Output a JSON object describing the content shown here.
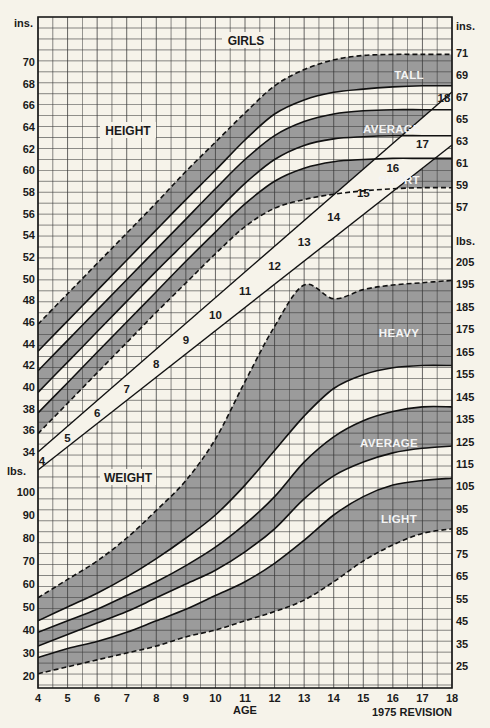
{
  "chart_data": {
    "type": "line",
    "title": "GIRLS",
    "subtitle": "1975 REVISION",
    "xlabel": "AGE",
    "x": [
      4,
      5,
      6,
      7,
      8,
      9,
      10,
      11,
      12,
      13,
      14,
      15,
      16,
      17,
      18
    ],
    "sections": {
      "height": {
        "label": "HEIGHT",
        "unit_left": "ins.",
        "unit_right": "ins.",
        "left_ticks": [
          34,
          36,
          38,
          40,
          42,
          44,
          46,
          48,
          50,
          52,
          54,
          56,
          58,
          60,
          62,
          64,
          66,
          68,
          70
        ],
        "right_ticks": [
          57,
          59,
          61,
          63,
          65,
          67,
          69,
          71
        ],
        "bands": [
          {
            "name": "TALL",
            "upper_dashed": true
          },
          {
            "name": "AVERAGE",
            "upper_dashed": false
          },
          {
            "name": "SHORT",
            "lower_dashed": true
          }
        ],
        "series": [
          {
            "name": "tall-upper (dashed)",
            "values": [
              45.8,
              48.6,
              51.4,
              54.2,
              57.0,
              59.9,
              62.6,
              65.3,
              67.8,
              69.3,
              70.2,
              70.6,
              70.7,
              70.7,
              70.7
            ]
          },
          {
            "name": "tall-lower",
            "values": [
              43.3,
              46.1,
              48.9,
              51.7,
              54.5,
              57.3,
              60.0,
              62.8,
              65.2,
              66.5,
              67.2,
              67.5,
              67.7,
              67.8,
              67.8
            ]
          },
          {
            "name": "average-upper",
            "values": [
              41.5,
              44.3,
              47.1,
              49.9,
              52.7,
              55.5,
              58.3,
              61.0,
              63.2,
              64.5,
              65.2,
              65.5,
              65.6,
              65.6,
              65.6
            ]
          },
          {
            "name": "average-lower",
            "values": [
              39.5,
              42.3,
              45.1,
              47.9,
              50.7,
              53.4,
              56.1,
              58.8,
              61.0,
              62.3,
              62.9,
              63.1,
              63.2,
              63.2,
              63.2
            ]
          },
          {
            "name": "short-upper",
            "values": [
              37.6,
              40.4,
              43.2,
              46.0,
              48.8,
              51.6,
              54.3,
              56.9,
              59.0,
              60.2,
              60.8,
              61.0,
              61.1,
              61.1,
              61.1
            ]
          },
          {
            "name": "short-lower (dashed)",
            "values": [
              35.7,
              38.5,
              41.3,
              44.1,
              46.9,
              49.6,
              52.3,
              54.8,
              56.5,
              57.3,
              57.8,
              58.1,
              58.3,
              58.4,
              58.4
            ]
          }
        ]
      },
      "weight": {
        "label": "WEIGHT",
        "unit_left": "lbs.",
        "unit_right": "lbs.",
        "left_ticks": [
          20,
          30,
          40,
          50,
          60,
          70,
          80,
          90,
          100
        ],
        "right_ticks": [
          25,
          35,
          45,
          55,
          65,
          75,
          85,
          95,
          105,
          115,
          125,
          135,
          145,
          155,
          165,
          175,
          185,
          195,
          205
        ],
        "bands": [
          {
            "name": "HEAVY",
            "upper_dashed": true
          },
          {
            "name": "AVERAGE",
            "upper_dashed": false
          },
          {
            "name": "LIGHT",
            "lower_dashed": true
          }
        ],
        "series": [
          {
            "name": "heavy-upper (dashed)",
            "values": [
              54,
              62,
              70,
              80,
              92,
              105,
              123,
              148,
              172,
              190,
              184,
              188,
              190,
              191,
              192
            ]
          },
          {
            "name": "heavy-lower",
            "values": [
              44,
              50,
              56,
              63,
              71,
              80,
              90,
              103,
              118,
              133,
              145,
              151,
              154,
              155,
              155
            ]
          },
          {
            "name": "average-upper",
            "values": [
              39,
              44,
              49,
              55,
              61,
              68,
              76,
              86,
              98,
              113,
              124,
              131,
              135,
              137,
              137
            ]
          },
          {
            "name": "average-lower",
            "values": [
              33,
              38,
              43,
              48,
              54,
              60,
              66,
              74,
              84,
              97,
              107,
              113,
              117,
              119,
              120
            ]
          },
          {
            "name": "light-upper",
            "values": [
              28,
              32,
              35,
              39,
              44,
              49,
              55,
              61,
              69,
              79,
              90,
              98,
              103,
              105,
              106
            ]
          },
          {
            "name": "light-lower (dashed)",
            "values": [
              21,
              24,
              27,
              30,
              33,
              37,
              40,
              44,
              48,
              53,
              61,
              70,
              77,
              82,
              84
            ]
          }
        ]
      },
      "age_scale_diagonal": {
        "labels": [
          4,
          5,
          6,
          7,
          8,
          9,
          10,
          11,
          12,
          13,
          14,
          15,
          16,
          17,
          18
        ]
      }
    },
    "axes": {
      "x_ticks": [
        4,
        5,
        6,
        7,
        8,
        9,
        10,
        11,
        12,
        13,
        14,
        15,
        16,
        17,
        18
      ],
      "height_ylim": [
        34,
        71
      ],
      "weight_ylim": [
        20,
        205
      ]
    },
    "grid": true,
    "legend_position": "inline band labels"
  },
  "labels": {
    "title": "GIRLS",
    "height": "HEIGHT",
    "weight": "WEIGHT",
    "age": "AGE",
    "revision": "1975 REVISION",
    "ins_left": "ins.",
    "ins_right": "ins.",
    "lbs_left": "lbs.",
    "lbs_right": "lbs.",
    "tall": "TALL",
    "avg_h": "AVERAGE",
    "short": "SHORT",
    "heavy": "HEAVY",
    "avg_w": "AVERAGE",
    "light": "LIGHT"
  },
  "colors": {
    "background": "#f6f3ea",
    "band_fill": "#9b9b9b",
    "grid": "#3a3a3a",
    "line": "#111111"
  }
}
